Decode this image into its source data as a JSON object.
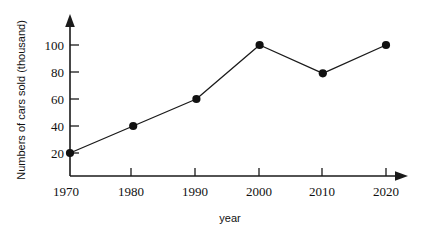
{
  "chart_data": {
    "type": "line",
    "title": "",
    "xlabel": "year",
    "ylabel": "Numbers of cars sold (thousand)",
    "categories": [
      "1970",
      "1980",
      "1990",
      "2000",
      "2010",
      "2020"
    ],
    "x": [
      1970,
      1980,
      1990,
      2000,
      2010,
      2020
    ],
    "values": [
      20,
      40,
      60,
      100,
      79,
      100
    ],
    "series": [
      {
        "name": "Numbers of cars sold",
        "values": [
          20,
          40,
          60,
          100,
          79,
          100
        ]
      }
    ],
    "xtick_labels": [
      "1970",
      "1980",
      "1990",
      "2000",
      "2010",
      "2020"
    ],
    "ytick_labels": [
      "20",
      "40",
      "60",
      "80",
      "100"
    ],
    "yticks": [
      20,
      40,
      60,
      80,
      100
    ],
    "xlim": [
      1970,
      2025
    ],
    "ylim": [
      0,
      112
    ],
    "grid": false,
    "legend": false,
    "legend_position": "none",
    "marker": "filled-circle",
    "line_color": "#1a1a1a",
    "marker_color": "#111111",
    "axis_color": "#1a1a1a",
    "background_color": "#ffffff",
    "axis_arrows": true
  },
  "axes": {
    "y_label": "Numbers of cars sold (thousand)",
    "x_label": "year",
    "y_ticks": [
      {
        "label": "20",
        "value": 20
      },
      {
        "label": "40",
        "value": 40
      },
      {
        "label": "60",
        "value": 60
      },
      {
        "label": "80",
        "value": 80
      },
      {
        "label": "100",
        "value": 100
      }
    ],
    "x_ticks": [
      {
        "label": "1970",
        "value": 1970
      },
      {
        "label": "1980",
        "value": 1980
      },
      {
        "label": "1990",
        "value": 1990
      },
      {
        "label": "2000",
        "value": 2000
      },
      {
        "label": "2010",
        "value": 2010
      },
      {
        "label": "2020",
        "value": 2020
      }
    ]
  },
  "points": [
    {
      "label": "1970",
      "value": "20"
    },
    {
      "label": "1980",
      "value": "40"
    },
    {
      "label": "1990",
      "value": "60"
    },
    {
      "label": "2000",
      "value": "100"
    },
    {
      "label": "2010",
      "value": "79"
    },
    {
      "label": "2020",
      "value": "100"
    }
  ]
}
